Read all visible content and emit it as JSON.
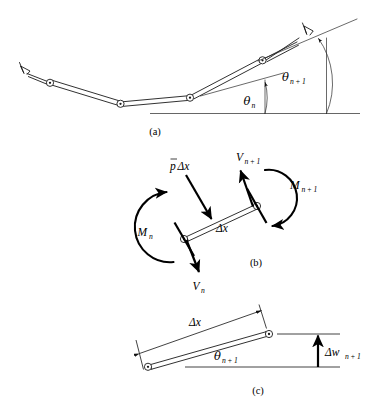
{
  "figure": {
    "panels": [
      {
        "id": "a",
        "label": "(a)",
        "description": "Chain of rigid links joined by hinges over a horizontal datum",
        "angle_labels": [
          {
            "base": "θ",
            "sub": "n",
            "name": "theta-n"
          },
          {
            "base": "θ",
            "sub": "n + 1",
            "name": "theta-n-plus-1"
          }
        ]
      },
      {
        "id": "b",
        "label": "(b)",
        "description": "Free-body diagram of a single element",
        "load_label": {
          "base": "p",
          "overbar": true,
          "suffix": "Δx",
          "name": "distributed-load"
        },
        "shear_labels": [
          {
            "base": "V",
            "sub": "n + 1",
            "name": "shear-n-plus-1"
          },
          {
            "base": "V",
            "sub": "n",
            "name": "shear-n"
          }
        ],
        "moment_labels": [
          {
            "base": "M",
            "sub": "n + 1",
            "name": "moment-n-plus-1"
          },
          {
            "base": "M",
            "sub": "n",
            "name": "moment-n"
          }
        ],
        "length_label": {
          "base": "Δx",
          "name": "element-length"
        }
      },
      {
        "id": "c",
        "label": "(c)",
        "description": "Geometry of one element: horizontal span, inclination, vertical rise",
        "span_label": {
          "base": "Δx",
          "name": "horizontal-span"
        },
        "angle_label": {
          "base": "θ",
          "sub": "n + 1",
          "name": "theta-n-plus-1-geom"
        },
        "rise_label": {
          "base": "Δw",
          "sub": "n + 1",
          "name": "vertical-rise"
        }
      }
    ],
    "colors": {
      "line": "#1a1a1a",
      "ground": "#555555",
      "heavy": "#000000",
      "background": "#ffffff"
    }
  }
}
